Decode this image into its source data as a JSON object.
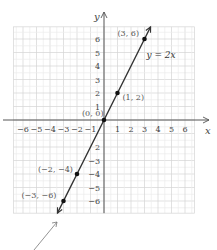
{
  "chart_data": {
    "type": "line",
    "title": "",
    "xlabel": "x",
    "ylabel": "y",
    "xlim": [
      -6.7,
      6.7
    ],
    "ylim": [
      -6.9,
      6.9
    ],
    "grid": true,
    "x_ticks": [
      -6,
      -5,
      -4,
      -3,
      -2,
      -1,
      1,
      2,
      3,
      4,
      5,
      6
    ],
    "y_ticks": [
      -6,
      -5,
      -4,
      -3,
      -2,
      -1,
      1,
      2,
      3,
      4,
      5,
      6
    ],
    "x_tick_labels": [
      "−6",
      "−5",
      "−4",
      "−3",
      "−2",
      "−1",
      "1",
      "2",
      "3",
      "4",
      "5",
      "6"
    ],
    "y_tick_labels_pos": [
      "1",
      "2",
      "3",
      "4",
      "5",
      "6"
    ],
    "y_tick_labels_neg": [
      "2",
      "3",
      "4",
      "5",
      "6"
    ],
    "y_tick_labels_neg_prefix": [
      "",
      "−",
      "−",
      "−",
      "−"
    ],
    "series": [
      {
        "name": "y = 2x",
        "equation": "y = 2x",
        "x": [
          -3,
          -2,
          0,
          1,
          3
        ],
        "y": [
          -6,
          -4,
          0,
          2,
          6
        ]
      }
    ],
    "points": [
      {
        "x": 3,
        "y": 6,
        "label": "(3, 6)"
      },
      {
        "x": 1,
        "y": 2,
        "label": "(1, 2)"
      },
      {
        "x": 0,
        "y": 0,
        "label": "(0, 0)"
      },
      {
        "x": -2,
        "y": -4,
        "label": "(−2, −4)"
      },
      {
        "x": -3,
        "y": -6,
        "label": "(−3, −6)"
      }
    ],
    "annotations": [
      {
        "text": "y = 2x",
        "at": [
          3.1,
          4.5
        ]
      },
      {
        "text": "pointer arrow toward lower end of line",
        "at": [
          -3.3,
          -7.5
        ]
      }
    ],
    "legend": "none"
  }
}
